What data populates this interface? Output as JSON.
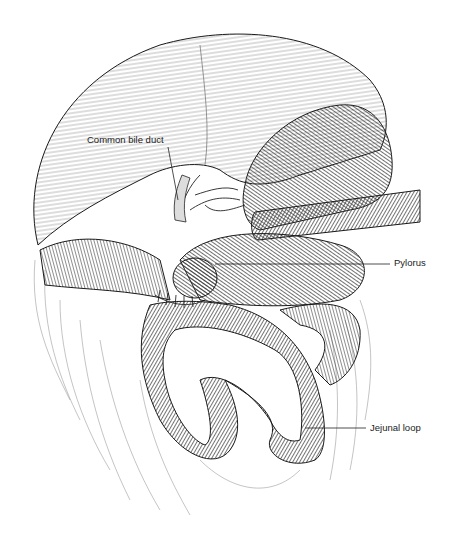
{
  "figure": {
    "labels": [
      {
        "id": "common-bile-duct",
        "text": "Common bile duct",
        "x": 87,
        "y": 140
      },
      {
        "id": "pylorus",
        "text": "Pylorus",
        "x": 394,
        "y": 261
      },
      {
        "id": "jejunal-loop",
        "text": "Jejunal loop",
        "x": 370,
        "y": 426
      }
    ],
    "colors": {
      "background": "#ffffff",
      "line": "#1a1a1a",
      "hatch": "#555555",
      "label_text": "#222222"
    }
  }
}
